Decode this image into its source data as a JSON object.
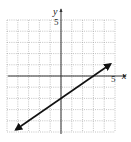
{
  "chart_data": {
    "type": "line",
    "title": "",
    "xlabel": "x",
    "ylabel": "y",
    "xlim": [
      -5,
      5
    ],
    "ylim": [
      -5,
      5
    ],
    "grid": true,
    "grid_style": "dotted",
    "grid_step": 1,
    "tick_labels": {
      "x": [
        "5"
      ],
      "y": [
        "5"
      ]
    },
    "series": [
      {
        "name": "line",
        "equation": "y = (2/3)x - 2",
        "slope": 0.6667,
        "intercept": -2,
        "x_intercept": 3,
        "x": [
          -4.2,
          0,
          3,
          4.6
        ],
        "y": [
          -4.8,
          -2,
          0,
          1.07
        ],
        "arrows": "both"
      }
    ],
    "legend": null
  },
  "colors": {
    "axis": "#333333",
    "grid": "#9a9a9a",
    "line": "#111111"
  },
  "labels": {
    "x_axis": "x",
    "y_axis": "y",
    "x_tick_max": "5",
    "y_tick_max": "5"
  }
}
